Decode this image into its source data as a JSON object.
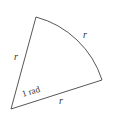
{
  "diagram": {
    "title": "",
    "labels": {
      "left_side": "r",
      "arc": "r",
      "bottom_side": "r",
      "angle": "1 rad"
    },
    "colors": {
      "stroke": "#444444",
      "text": "#333333",
      "background": "#ffffff"
    }
  }
}
